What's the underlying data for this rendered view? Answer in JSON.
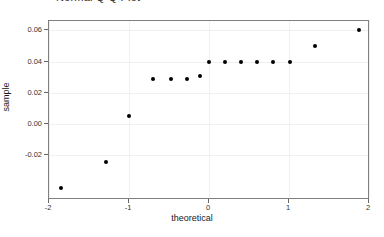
{
  "figure": {
    "clipped_title": "Normal Q-Q Plot",
    "background_color": "#ffffff",
    "frame_color": "#808080",
    "grid_color": "#f0f0f0",
    "point_color": "#000000"
  },
  "chart_data": {
    "type": "scatter",
    "title": "",
    "xlabel": "theoretical",
    "ylabel": "sample",
    "xlim": [
      -2.0,
      2.0
    ],
    "ylim": [
      -0.048,
      0.066
    ],
    "xticks": [
      -2,
      -1,
      0,
      1,
      2
    ],
    "xtick_labels": [
      "-2",
      "-1",
      "0",
      "1",
      "2"
    ],
    "yticks": [
      -0.02,
      0.0,
      0.02,
      0.04,
      0.06
    ],
    "ytick_labels": [
      "-0.02",
      "0.00",
      "0.02",
      "0.04",
      "0.06"
    ],
    "grid": true,
    "legend": null,
    "marker": "circle",
    "marker_size": 4,
    "n_points": 15,
    "x": [
      -1.85,
      -1.29,
      -1.0,
      -0.7,
      -0.48,
      -0.28,
      -0.11,
      0.0,
      0.2,
      0.4,
      0.6,
      0.8,
      1.01,
      1.33,
      1.87
    ],
    "y": [
      -0.041,
      -0.024,
      0.005,
      0.029,
      0.029,
      0.029,
      0.031,
      0.04,
      0.04,
      0.04,
      0.04,
      0.04,
      0.04,
      0.05,
      0.06
    ],
    "points": [
      {
        "theoretical": -1.85,
        "sample": -0.041
      },
      {
        "theoretical": -1.29,
        "sample": -0.024
      },
      {
        "theoretical": -1.0,
        "sample": 0.005
      },
      {
        "theoretical": -0.7,
        "sample": 0.029
      },
      {
        "theoretical": -0.48,
        "sample": 0.029
      },
      {
        "theoretical": -0.28,
        "sample": 0.029
      },
      {
        "theoretical": -0.11,
        "sample": 0.031
      },
      {
        "theoretical": 0.0,
        "sample": 0.04
      },
      {
        "theoretical": 0.2,
        "sample": 0.04
      },
      {
        "theoretical": 0.4,
        "sample": 0.04
      },
      {
        "theoretical": 0.6,
        "sample": 0.04
      },
      {
        "theoretical": 0.8,
        "sample": 0.04
      },
      {
        "theoretical": 1.01,
        "sample": 0.04
      },
      {
        "theoretical": 1.33,
        "sample": 0.05
      },
      {
        "theoretical": 1.87,
        "sample": 0.06
      }
    ]
  }
}
